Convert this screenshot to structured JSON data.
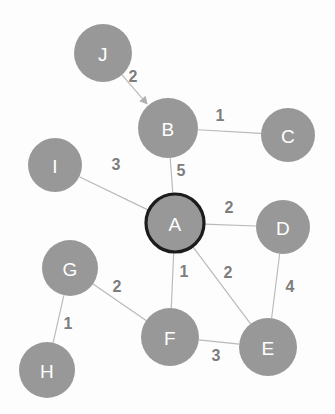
{
  "diagram": {
    "type": "weighted-graph",
    "title": "",
    "canvas": {
      "width": 335,
      "height": 414,
      "background": "#fdfdfd"
    },
    "style": {
      "node_fill": "#989898",
      "node_label_color": "#ffffff",
      "edge_color": "#b9b9b9",
      "weight_color": "#7d7d7d",
      "highlight_stroke": "#1c1c1c"
    },
    "nodes": [
      {
        "id": "J",
        "label": "J",
        "cx": 103,
        "cy": 53,
        "r": 29,
        "highlighted": false
      },
      {
        "id": "B",
        "label": "B",
        "cx": 168,
        "cy": 128,
        "r": 30,
        "highlighted": false
      },
      {
        "id": "C",
        "label": "C",
        "cx": 288,
        "cy": 135,
        "r": 27,
        "highlighted": false
      },
      {
        "id": "I",
        "label": "I",
        "cx": 55,
        "cy": 165,
        "r": 27,
        "highlighted": false
      },
      {
        "id": "A",
        "label": "A",
        "cx": 175,
        "cy": 223,
        "r": 29,
        "highlighted": true
      },
      {
        "id": "D",
        "label": "D",
        "cx": 283,
        "cy": 227,
        "r": 27,
        "highlighted": false
      },
      {
        "id": "G",
        "label": "G",
        "cx": 70,
        "cy": 268,
        "r": 28,
        "highlighted": false
      },
      {
        "id": "F",
        "label": "F",
        "cx": 170,
        "cy": 337,
        "r": 29,
        "highlighted": false
      },
      {
        "id": "E",
        "label": "E",
        "cx": 268,
        "cy": 347,
        "r": 29,
        "highlighted": false
      },
      {
        "id": "H",
        "label": "H",
        "cx": 47,
        "cy": 370,
        "r": 28,
        "highlighted": false
      }
    ],
    "edges": [
      {
        "from": "J",
        "to": "B",
        "weight": "2",
        "directed": true,
        "label_x": 133,
        "label_y": 76
      },
      {
        "from": "B",
        "to": "C",
        "weight": "1",
        "directed": false,
        "label_x": 220,
        "label_y": 115
      },
      {
        "from": "B",
        "to": "A",
        "weight": "5",
        "directed": false,
        "label_x": 181,
        "label_y": 170
      },
      {
        "from": "I",
        "to": "A",
        "weight": "3",
        "directed": false,
        "label_x": 116,
        "label_y": 164
      },
      {
        "from": "A",
        "to": "D",
        "weight": "2",
        "directed": false,
        "label_x": 229,
        "label_y": 207
      },
      {
        "from": "A",
        "to": "F",
        "weight": "1",
        "directed": false,
        "label_x": 184,
        "label_y": 271
      },
      {
        "from": "A",
        "to": "E",
        "weight": "2",
        "directed": false,
        "label_x": 228,
        "label_y": 272
      },
      {
        "from": "D",
        "to": "E",
        "weight": "4",
        "directed": false,
        "label_x": 290,
        "label_y": 286
      },
      {
        "from": "G",
        "to": "F",
        "weight": "2",
        "directed": false,
        "label_x": 117,
        "label_y": 286
      },
      {
        "from": "G",
        "to": "H",
        "weight": "1",
        "directed": false,
        "label_x": 68,
        "label_y": 323
      },
      {
        "from": "F",
        "to": "E",
        "weight": "3",
        "directed": false,
        "label_x": 216,
        "label_y": 355
      }
    ]
  }
}
